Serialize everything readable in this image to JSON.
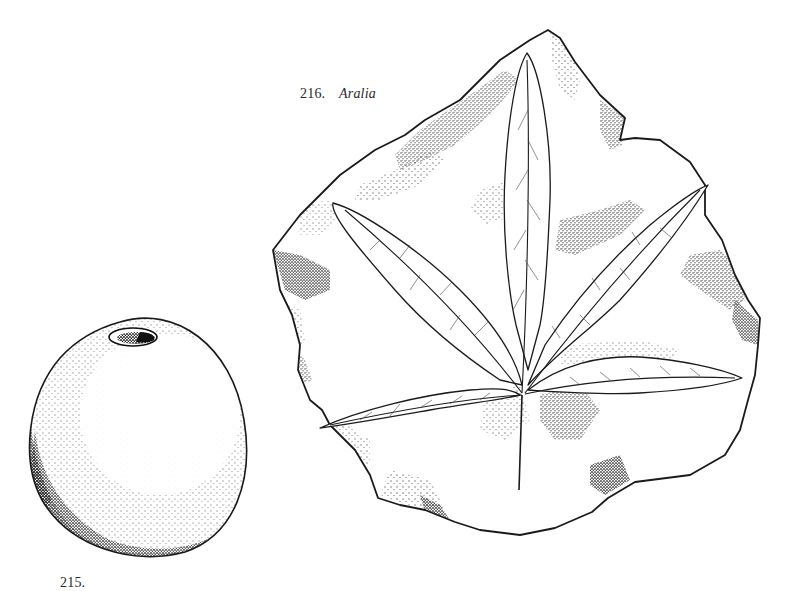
{
  "figures": [
    {
      "id": "aralia",
      "number": "216.",
      "taxon": "Aralia",
      "subject": "fossil leaf impression on rock slab",
      "lobes": 5
    },
    {
      "id": "seed",
      "number": "215.",
      "taxon": "",
      "subject": "stippled ovoid seed/fruit with apical pore",
      "caption_truncated": true
    }
  ],
  "style": {
    "ink_color": "#1a1a1a",
    "paper_color": "#ffffff",
    "stipple_color": "#333333"
  }
}
